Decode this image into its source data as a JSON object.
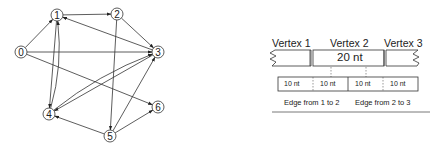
{
  "graph": {
    "nodes": [
      {
        "id": "0",
        "x": 21,
        "y": 52
      },
      {
        "id": "1",
        "x": 57,
        "y": 15
      },
      {
        "id": "2",
        "x": 117,
        "y": 14
      },
      {
        "id": "3",
        "x": 158,
        "y": 52
      },
      {
        "id": "4",
        "x": 49,
        "y": 114
      },
      {
        "id": "5",
        "x": 110,
        "y": 136
      },
      {
        "id": "6",
        "x": 158,
        "y": 107
      }
    ],
    "edges": [
      {
        "from": "0",
        "to": "1"
      },
      {
        "from": "0",
        "to": "3"
      },
      {
        "from": "0",
        "to": "6"
      },
      {
        "from": "1",
        "to": "2"
      },
      {
        "from": "1",
        "to": "4"
      },
      {
        "from": "2",
        "to": "3"
      },
      {
        "from": "2",
        "to": "5"
      },
      {
        "from": "3",
        "to": "1"
      },
      {
        "from": "3",
        "to": "4"
      },
      {
        "from": "4",
        "to": "1",
        "curved": true
      },
      {
        "from": "4",
        "to": "3",
        "curved": true
      },
      {
        "from": "5",
        "to": "3"
      },
      {
        "from": "5",
        "to": "4"
      },
      {
        "from": "5",
        "to": "6"
      }
    ]
  },
  "sequence": {
    "vertex_labels": [
      "Vertex 1",
      "Vertex 2",
      "Vertex 3"
    ],
    "vertex2_length": "20 nt",
    "edge_segments": [
      "10 nt",
      "10 nt",
      "10 nt",
      "10 nt"
    ],
    "captions": [
      "Edge from 1 to 2",
      "Edge from 2 to 3"
    ]
  }
}
